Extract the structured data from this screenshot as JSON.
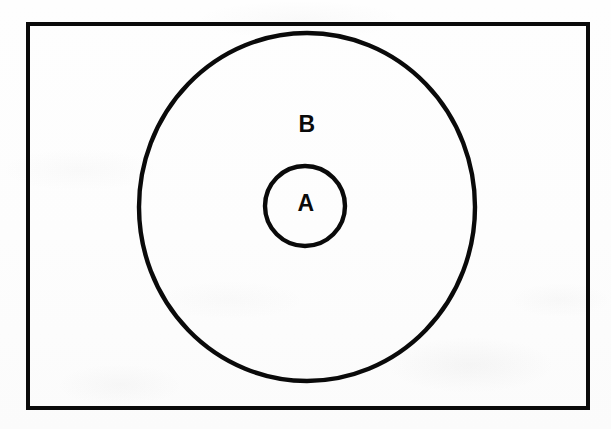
{
  "figure": {
    "kind": "euler-diagram",
    "background_color": "#fdfdfd",
    "ink_color": "#0a0a0a"
  },
  "universe": {
    "shape": "rectangle",
    "name": "universal-set-rectangle",
    "x": 26,
    "y": 22,
    "width": 564,
    "height": 388,
    "stroke_width": 4,
    "stroke_color": "#0a0a0a",
    "fill": "none",
    "label": ""
  },
  "sets": [
    {
      "id": "B",
      "label": "B",
      "shape": "ellipse",
      "cx": 307,
      "cy": 207,
      "rx": 170,
      "ry": 176,
      "stroke_width": 4,
      "stroke_color": "#0a0a0a",
      "fill": "none",
      "label_x": 307,
      "label_y": 124
    },
    {
      "id": "A",
      "label": "A",
      "shape": "ellipse",
      "cx": 305,
      "cy": 206,
      "rx": 42,
      "ry": 42,
      "stroke_width": 4,
      "stroke_color": "#0a0a0a",
      "fill": "none",
      "label_x": 306,
      "label_y": 203
    }
  ],
  "relations": [
    {
      "subset": "A",
      "superset": "B",
      "type": "proper-subset"
    }
  ]
}
